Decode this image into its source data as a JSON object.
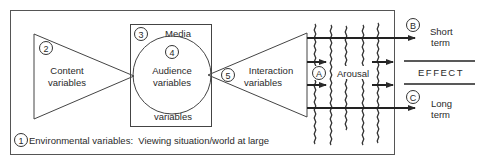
{
  "diagram": {
    "environment": {
      "number": "1",
      "label": "Environmental variables:  Viewing situation/world at large"
    },
    "content": {
      "number": "2",
      "line1": "Content",
      "line2": "variables"
    },
    "media": {
      "number": "3",
      "label": "Media",
      "bottom_label": "variables"
    },
    "audience": {
      "number": "4",
      "line1": "Audience",
      "line2": "variables"
    },
    "interaction": {
      "number": "5",
      "line1": "Interaction",
      "line2": "variables"
    },
    "arousal": {
      "letter": "A",
      "label": "Arousal"
    },
    "short_term": {
      "letter": "B",
      "line1": "Short",
      "line2": "term"
    },
    "long_term": {
      "letter": "C",
      "line1": "Long",
      "line2": "term"
    },
    "effect": {
      "label": "EFFECT"
    },
    "colors": {
      "line": "#2a2a2a",
      "background": "#ffffff"
    }
  }
}
